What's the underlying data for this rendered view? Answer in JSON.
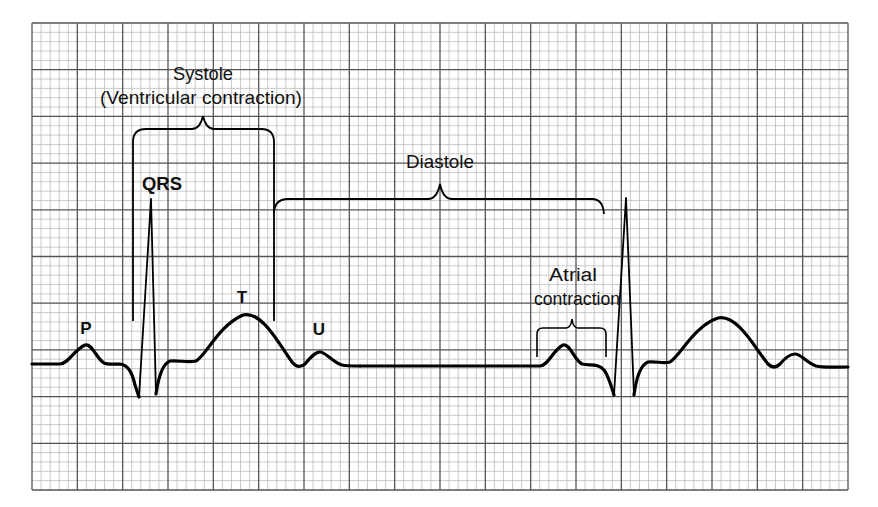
{
  "diagram": {
    "type": "ecg-cardiac-cycle",
    "background": "#ffffff",
    "grid": {
      "x0": 32,
      "y0": 23,
      "x1": 848,
      "y1": 490,
      "major_cols": 18,
      "major_rows": 10,
      "minor_per_major": 5,
      "minor_color": "#bdbdbd",
      "major_color": "#555555"
    },
    "trace_color": "#000000",
    "labels": {
      "systole": "Systole",
      "systole_sub": "(Ventricular contraction)",
      "diastole": "Diastole",
      "atrial_line1": "Atrial",
      "atrial_line2": "contraction",
      "qrs": "QRS",
      "p": "P",
      "t": "T",
      "u": "U"
    }
  }
}
